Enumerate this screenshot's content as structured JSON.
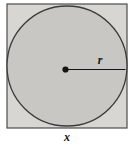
{
  "figure": {
    "type": "geometry-diagram",
    "labels": {
      "radius": "r",
      "side": "x"
    },
    "colors": {
      "background": "#ffffff",
      "square_fill": "#d7d6d2",
      "square_stroke": "#4b4b49",
      "circle_fill": "#c8c7c3",
      "circle_stroke": "#3b3b39",
      "ink": "#141414"
    },
    "geometry": {
      "square": {
        "x": 7,
        "y": 4,
        "width": 120,
        "height": 124
      },
      "circle": {
        "cx": 67,
        "cy": 66,
        "r": 60
      },
      "center_dot": {
        "cx": 65.5,
        "cy": 69.5,
        "r": 3.1
      },
      "radius_line": {
        "x1": 65.5,
        "y1": 69.5,
        "x2": 125.5,
        "y2": 69.5
      },
      "radius_label_pos": {
        "x": 100,
        "y": 64
      },
      "side_label_pos": {
        "x": 67,
        "y": 141
      }
    }
  }
}
